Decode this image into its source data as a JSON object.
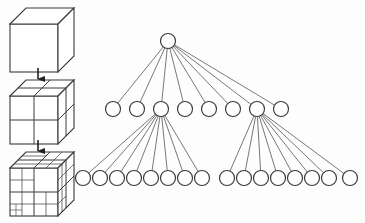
{
  "figure": {
    "caption": "",
    "background_color": "#fdfdfd",
    "stroke_color": "#3a3a3a",
    "edge_color": "#555555",
    "node_fill": "#ffffff",
    "width": 365,
    "height": 223
  },
  "cube_column": {
    "label": "subdivision-sequence",
    "cubes": [
      {
        "name": "cube-level-0",
        "subdivision_label": "undivided cube",
        "level": 0,
        "cells": 1,
        "x": 10,
        "y": 8,
        "size": 48,
        "depth": 16
      },
      {
        "name": "cube-level-1",
        "subdivision_label": "2 x 2 x 2 subdivision",
        "level": 1,
        "cells": 8,
        "x": 10,
        "y": 80,
        "size": 48,
        "depth": 16
      },
      {
        "name": "cube-level-2",
        "subdivision_label": "recursive octree subdivision",
        "level": 2,
        "cells": 64,
        "x": 10,
        "y": 152,
        "size": 48,
        "depth": 16
      }
    ],
    "arrows": [
      {
        "name": "arrow-level-0-to-1",
        "x": 38,
        "y1": 68,
        "y2": 79
      },
      {
        "name": "arrow-level-1-to-2",
        "x": 38,
        "y1": 140,
        "y2": 151
      }
    ]
  },
  "tree": {
    "label": "octree-node-tree",
    "node_radius": 7.5,
    "levels": [
      {
        "name": "root-level",
        "depth": 0,
        "y": 41,
        "count": 1,
        "nodes": [
          {
            "id": "root",
            "x": 168
          }
        ]
      },
      {
        "name": "children-level",
        "depth": 1,
        "y": 109,
        "count": 8,
        "start_x": 113,
        "spacing": 24,
        "nodes": [
          {
            "id": "n1",
            "x": 113
          },
          {
            "id": "n2",
            "x": 137
          },
          {
            "id": "n3",
            "x": 161,
            "expanded": true
          },
          {
            "id": "n4",
            "x": 185
          },
          {
            "id": "n5",
            "x": 209
          },
          {
            "id": "n6",
            "x": 233
          },
          {
            "id": "n7",
            "x": 257,
            "expanded": true
          },
          {
            "id": "n8",
            "x": 281
          }
        ]
      },
      {
        "name": "grandchildren-level",
        "depth": 2,
        "y": 178,
        "count": 16,
        "nodes": [
          {
            "id": "g1",
            "x": 83,
            "parent": "n3"
          },
          {
            "id": "g2",
            "x": 100,
            "parent": "n3"
          },
          {
            "id": "g3",
            "x": 117,
            "parent": "n3"
          },
          {
            "id": "g4",
            "x": 134,
            "parent": "n3"
          },
          {
            "id": "g5",
            "x": 151,
            "parent": "n3"
          },
          {
            "id": "g6",
            "x": 168,
            "parent": "n3"
          },
          {
            "id": "g7",
            "x": 185,
            "parent": "n3"
          },
          {
            "id": "g8",
            "x": 202,
            "parent": "n3"
          },
          {
            "id": "g9",
            "x": 227,
            "parent": "n7"
          },
          {
            "id": "g10",
            "x": 244,
            "parent": "n7"
          },
          {
            "id": "g11",
            "x": 261,
            "parent": "n7"
          },
          {
            "id": "g12",
            "x": 278,
            "parent": "n7"
          },
          {
            "id": "g13",
            "x": 295,
            "parent": "n7"
          },
          {
            "id": "g14",
            "x": 312,
            "parent": "n7"
          },
          {
            "id": "g15",
            "x": 329,
            "parent": "n7"
          },
          {
            "id": "g16",
            "x": 350,
            "parent": "n7"
          }
        ]
      }
    ],
    "edge_groups": [
      {
        "name": "root-to-children",
        "from": "root",
        "to_level": 1,
        "count": 8
      },
      {
        "name": "node3-to-grandchildren",
        "from": "n3",
        "to_level": 2,
        "count": 8
      },
      {
        "name": "node7-to-grandchildren",
        "from": "n7",
        "to_level": 2,
        "count": 8
      }
    ]
  }
}
